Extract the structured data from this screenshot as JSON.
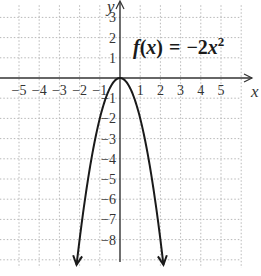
{
  "chart_data": {
    "type": "line",
    "equation": {
      "prefix": "f",
      "open": "(",
      "var": "x",
      "close": ")",
      "eq": "=",
      "rhs_coef": "−2",
      "rhs_var": "x",
      "rhs_exp": "2"
    },
    "xlabel": "x",
    "ylabel": "y",
    "xlim": [
      -6,
      6
    ],
    "ylim": [
      -10,
      4
    ],
    "grid": true,
    "grid_style": "dotted",
    "x_ticks": [
      -5,
      -4,
      -3,
      -2,
      -1,
      1,
      2,
      3,
      4,
      5
    ],
    "y_ticks": [
      3,
      2,
      1,
      -1,
      -2,
      -3,
      -4,
      -5,
      -6,
      -7,
      -8
    ],
    "x_tick_labels": [
      "−5",
      "−4",
      "−3",
      "−2",
      "−1",
      "1",
      "2",
      "3",
      "4",
      "5"
    ],
    "y_tick_labels": [
      "3",
      "2",
      "1",
      "−1",
      "−2",
      "−3",
      "−4",
      "−5",
      "−6",
      "−7",
      "−8"
    ],
    "series": [
      {
        "name": "f(x) = -2x^2",
        "function": "-2*x^2",
        "x": [
          -2.15,
          -2,
          -1.5,
          -1,
          -0.5,
          0,
          0.5,
          1,
          1.5,
          2,
          2.15
        ],
        "y": [
          -9.245,
          -8,
          -4.5,
          -2,
          -0.5,
          0,
          -0.5,
          -2,
          -4.5,
          -8,
          -9.245
        ],
        "arrows_at_ends": true,
        "color": "#1a1a1a"
      }
    ],
    "vertex": [
      0,
      0
    ]
  },
  "colors": {
    "axis": "#333333",
    "grid": "#b8b8b8",
    "curve": "#1a1a1a",
    "background": "#ffffff"
  }
}
